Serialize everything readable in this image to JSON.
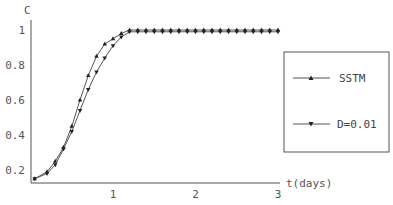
{
  "chart_data": {
    "type": "line",
    "title": "",
    "xlabel": "t(days)",
    "ylabel": "C",
    "xlim": [
      0,
      3
    ],
    "ylim": [
      0.13,
      1.02
    ],
    "x_ticks": [
      "1",
      "2",
      "3"
    ],
    "y_ticks": [
      "0.2",
      "0.4",
      "0.6",
      "0.8",
      "1"
    ],
    "grid": false,
    "legend_position": "right",
    "series": [
      {
        "name": "SSTM",
        "marker": "triangle-up",
        "x": [
          0.05,
          0.2,
          0.3,
          0.4,
          0.5,
          0.6,
          0.7,
          0.8,
          0.9,
          1.0,
          1.1,
          1.2,
          1.3,
          1.4,
          1.5,
          1.6,
          1.7,
          1.8,
          1.9,
          2.0,
          2.1,
          2.2,
          2.3,
          2.4,
          2.5,
          2.6,
          2.7,
          2.8,
          2.9,
          3.0
        ],
        "values": [
          0.15,
          0.19,
          0.25,
          0.33,
          0.45,
          0.6,
          0.74,
          0.85,
          0.92,
          0.95,
          0.98,
          1.0,
          1.0,
          1.0,
          1.0,
          1.0,
          1.0,
          1.0,
          1.0,
          1.0,
          1.0,
          1.0,
          1.0,
          1.0,
          1.0,
          1.0,
          1.0,
          1.0,
          1.0,
          1.0
        ]
      },
      {
        "name": "D=0.01",
        "marker": "triangle-down",
        "x": [
          0.05,
          0.2,
          0.3,
          0.4,
          0.5,
          0.6,
          0.7,
          0.8,
          0.9,
          1.0,
          1.1,
          1.2,
          1.3,
          1.4,
          1.5,
          1.6,
          1.7,
          1.8,
          1.9,
          2.0,
          2.1,
          2.2,
          2.3,
          2.4,
          2.5,
          2.6,
          2.7,
          2.8,
          2.9,
          3.0
        ],
        "values": [
          0.15,
          0.18,
          0.23,
          0.32,
          0.42,
          0.54,
          0.66,
          0.76,
          0.84,
          0.91,
          0.96,
          0.99,
          0.99,
          0.99,
          0.99,
          0.99,
          0.99,
          0.99,
          0.99,
          0.99,
          0.99,
          0.99,
          0.99,
          0.99,
          0.99,
          0.99,
          0.99,
          0.99,
          0.99,
          0.99
        ]
      }
    ]
  },
  "colors": {
    "axis": "#555555",
    "line": "#555555",
    "marker": "#222222"
  }
}
